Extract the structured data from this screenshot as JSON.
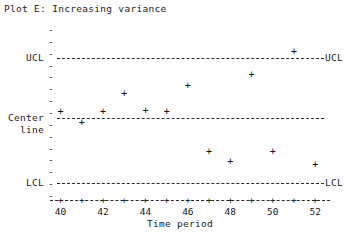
{
  "chart_data": {
    "type": "scatter",
    "title": "Plot E: Increasing variance",
    "xlabel": "Time period",
    "ylabel": "",
    "x": [
      40,
      41,
      42,
      43,
      44,
      45,
      46,
      47,
      48,
      49,
      50,
      51,
      52
    ],
    "values": [
      0.0,
      -0.7,
      0.0,
      1.15,
      0.05,
      0.0,
      1.65,
      -2.6,
      -3.2,
      2.4,
      -2.6,
      3.85,
      -3.4
    ],
    "marker": "+",
    "xlim": [
      39.5,
      52.7
    ],
    "ylim": [
      -5.4,
      5.4
    ],
    "xticks": [
      40,
      41,
      42,
      43,
      44,
      45,
      46,
      47,
      48,
      49,
      50,
      51,
      52
    ],
    "xtick_labels": [
      "40",
      "",
      "42",
      "",
      "44",
      "",
      "46",
      "",
      "48",
      "",
      "50",
      "",
      "52"
    ],
    "grid": false,
    "legend_position": "none",
    "control_limits": {
      "ucl": {
        "value": 4.6,
        "label_left": "UCL",
        "label_right": "UCL",
        "style": "dashed"
      },
      "center": {
        "value": 0.0,
        "label_left_line1": "Center",
        "label_left_line2": "line",
        "label_right": "",
        "style": "dashed"
      },
      "lcl": {
        "value": -4.6,
        "label_left": "LCL",
        "label_right": "LCL",
        "style": "dashed"
      }
    },
    "ytick_marks": "-",
    "center_row_marker": "+",
    "annotations": []
  },
  "colors": {
    "background": "#ffffff",
    "ink": "#1a1a1a",
    "marker": "#111111",
    "line": "#2a2a2a"
  }
}
